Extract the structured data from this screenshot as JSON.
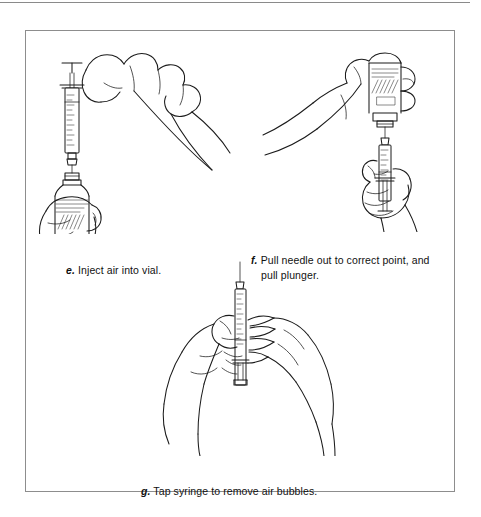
{
  "page": {
    "background_color": "#ffffff",
    "ink_color": "#1b1b1b",
    "rule_color": "#8a8a8a",
    "frame_color": "#8d8d8d"
  },
  "figure": {
    "type": "instructional-line-art",
    "panel_count": 3
  },
  "panels": [
    {
      "id": "e",
      "label": "e.",
      "caption": "Inject air into vial.",
      "caption_lines": [
        "Inject air into vial."
      ],
      "illustration_name": "hand-injecting-air-into-inverted-vial",
      "elements": [
        "right-hand-holding-plunger",
        "left-hand-gripping-inverted-vial",
        "syringe-barrel",
        "needle",
        "vial-with-label",
        "vial-cap"
      ]
    },
    {
      "id": "f",
      "label": "f.",
      "caption": "Pull needle out to correct point, and pull plunger.",
      "caption_lines": [
        "Pull needle out to correct point, and",
        "pull plunger."
      ],
      "illustration_name": "hands-pulling-plunger-from-inverted-vial",
      "elements": [
        "upper-hand-holding-vial",
        "lower-hand-pulling-plunger",
        "syringe-barrel",
        "needle",
        "vial-with-label",
        "graduation-marks"
      ]
    },
    {
      "id": "g",
      "label": "g.",
      "caption": "Tap syringe to remove air bubbles.",
      "caption_lines": [
        "Tap syringe to remove air bubbles."
      ],
      "illustration_name": "two-hands-tapping-syringe-barrel",
      "elements": [
        "left-hand-holding-syringe",
        "right-hand-tapping-finger",
        "syringe-barrel",
        "needle",
        "plunger",
        "graduation-marks"
      ]
    }
  ]
}
